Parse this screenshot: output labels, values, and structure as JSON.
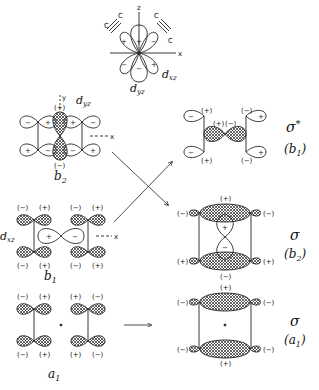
{
  "top_orbital": {
    "axis_z": "z",
    "axis_x": "x",
    "carbon": "C",
    "label_dxz": "d",
    "label_dxz_sub": "xz",
    "label_dyz": "d",
    "label_dyz_sub": "yz",
    "signs": {
      "center_up": "+",
      "left_up": "+",
      "right_up": "−",
      "left_down": "−",
      "center_down": "−",
      "right_down": "+"
    }
  },
  "left_column": {
    "b2": {
      "axis_y": "y",
      "axis_x": "x",
      "label": "d",
      "label_sub": "yz",
      "sym": "b",
      "sym_sub": "2",
      "top_sign": "(+)",
      "bottom_sign": "(−)",
      "lobe_signs_top": [
        "−",
        "+",
        "+",
        "−"
      ],
      "lobe_signs_bottom": [
        "+",
        "−",
        "−",
        "+"
      ]
    },
    "b1": {
      "axis_x": "x",
      "label": "d",
      "label_sub": "xz",
      "sym": "b",
      "sym_sub": "1",
      "top_signs": [
        "(−)",
        "(+)",
        "(−)",
        "(+)"
      ],
      "bottom_signs": [
        "(−)",
        "(+)",
        "(−)",
        "(+)"
      ],
      "center_signs": [
        "+",
        "−"
      ]
    },
    "a1": {
      "sym": "a",
      "sym_sub": "1",
      "top_signs": [
        "(−)",
        "(+)",
        "(+)",
        "(−)"
      ],
      "bottom_signs": [
        "(−)",
        "(+)",
        "(+)",
        "(−)"
      ]
    }
  },
  "right_column": {
    "sigma_star": {
      "sym": "σ",
      "star": "*",
      "irrep": "b",
      "irrep_sub": "1",
      "signs_top": [
        "(+)",
        "(−)"
      ],
      "signs_bottom": [
        "(+)",
        "(−)"
      ],
      "mid_signs": [
        "(+)",
        "(−)"
      ],
      "lobe_signs": [
        "−",
        "+",
        "−",
        "+"
      ]
    },
    "sigma_b2": {
      "sym": "σ",
      "irrep": "b",
      "irrep_sub": "2",
      "top_sign": "(+)",
      "bottom_sign": "(−)",
      "left_top": "(−)",
      "right_top": "(−)",
      "left_bottom": "(+)",
      "right_bottom": "(+)",
      "center_signs": [
        "+",
        "−"
      ]
    },
    "sigma_a1": {
      "sym": "σ",
      "irrep": "a",
      "irrep_sub": "1",
      "top_sign": "(+)",
      "bottom_sign": "(+)",
      "left_top": "(−)",
      "right_top": "(−)",
      "left_bottom": "(−)",
      "right_bottom": "(−)"
    }
  }
}
